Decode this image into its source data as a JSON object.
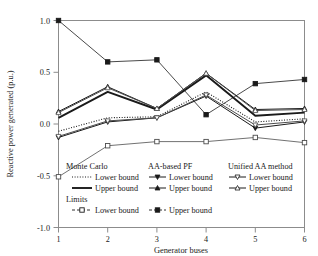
{
  "chart_data": {
    "type": "line",
    "title": "",
    "xlabel": "Generator buses",
    "ylabel": "Reactive power generated (p.u.)",
    "xlim": [
      1,
      6
    ],
    "ylim": [
      -1.0,
      1.0
    ],
    "xticks": [
      1,
      2,
      3,
      4,
      5,
      6
    ],
    "xtick_labels": [
      "1",
      "2",
      "3",
      "4",
      "5",
      "6"
    ],
    "yticks": [
      -1.0,
      -0.5,
      0.0,
      0.5,
      1.0
    ],
    "ytick_labels": [
      "-1.0",
      "-0.5",
      "0.0",
      "0.5",
      "1.0"
    ],
    "grid": false,
    "legend_position": "inside-lower-left",
    "x": [
      1,
      2,
      3,
      4,
      5,
      6
    ],
    "series": [
      {
        "name": "Monte Carlo Lower bound",
        "group": "Monte Carlo",
        "bound": "Lower bound",
        "style": "dotted",
        "marker": "none",
        "color": "#1a1a1a",
        "values": [
          -0.07,
          0.06,
          0.07,
          0.31,
          0.02,
          0.05
        ]
      },
      {
        "name": "Monte Carlo Upper bound",
        "group": "Monte Carlo",
        "bound": "Upper bound",
        "style": "solid-thick",
        "marker": "none",
        "color": "#1a1a1a",
        "values": [
          0.06,
          0.31,
          0.14,
          0.47,
          0.08,
          0.11
        ]
      },
      {
        "name": "AA-based PF Lower bound",
        "group": "AA-based PF",
        "bound": "Lower bound",
        "style": "solid",
        "marker": "triangle-down",
        "color": "#1a1a1a",
        "values": [
          -0.13,
          0.02,
          0.06,
          0.27,
          -0.04,
          0.02
        ]
      },
      {
        "name": "AA-based PF Upper bound",
        "group": "AA-based PF",
        "bound": "Upper bound",
        "style": "solid",
        "marker": "triangle-up",
        "color": "#1a1a1a",
        "values": [
          0.12,
          0.36,
          0.15,
          0.49,
          0.14,
          0.15
        ]
      },
      {
        "name": "Unified AA method Lower bound",
        "group": "Unified AA method",
        "bound": "Lower bound",
        "style": "solid",
        "marker": "triangle-down-open",
        "color": "#4d4d4d",
        "values": [
          -0.12,
          0.03,
          0.06,
          0.28,
          -0.01,
          0.03
        ]
      },
      {
        "name": "Unified AA method Upper bound",
        "group": "Unified AA method",
        "bound": "Upper bound",
        "style": "solid",
        "marker": "triangle-up-open",
        "color": "#4d4d4d",
        "values": [
          0.11,
          0.35,
          0.15,
          0.49,
          0.13,
          0.14
        ]
      },
      {
        "name": "Limits Lower bound",
        "group": "Limits",
        "bound": "Lower bound",
        "style": "solid-thin",
        "marker": "square-open",
        "color": "#4d4d4d",
        "values": [
          -0.51,
          -0.21,
          -0.17,
          -0.17,
          -0.13,
          -0.18
        ]
      },
      {
        "name": "Limits Upper bound",
        "group": "Limits",
        "bound": "Upper bound",
        "style": "solid-thin",
        "marker": "square-filled",
        "color": "#1a1a1a",
        "values": [
          1.0,
          0.6,
          0.62,
          0.09,
          0.39,
          0.43
        ]
      }
    ]
  },
  "axes": {
    "ylabel": "Reactive power generated (p.u.)",
    "xlabel": "Generator buses",
    "ytick_labels": [
      "1.0",
      "0.5",
      "0.0",
      "-0.5",
      "-1.0"
    ],
    "xtick_labels": [
      "1",
      "2",
      "3",
      "4",
      "5",
      "6"
    ]
  },
  "legend": {
    "groups": [
      {
        "heading": "Monte Carlo",
        "entries": [
          {
            "label": "Lower bound",
            "style": "dotted",
            "marker": "none"
          },
          {
            "label": "Upper bound",
            "style": "solid-thick",
            "marker": "none"
          }
        ]
      },
      {
        "heading": "AA-based PF",
        "entries": [
          {
            "label": "Lower bound",
            "style": "solid",
            "marker": "triangle-down"
          },
          {
            "label": "Upper bound",
            "style": "solid",
            "marker": "triangle-up"
          }
        ]
      },
      {
        "heading": "Unified AA method",
        "entries": [
          {
            "label": "Lower bound",
            "style": "solid",
            "marker": "triangle-down-open"
          },
          {
            "label": "Upper bound",
            "style": "solid",
            "marker": "triangle-up-open"
          }
        ]
      },
      {
        "heading": "Limits",
        "entries": [
          {
            "label": "Lower bound",
            "style": "dashed",
            "marker": "square-open"
          },
          {
            "label": "Upper bound",
            "style": "dashed",
            "marker": "square-filled"
          }
        ]
      }
    ]
  }
}
